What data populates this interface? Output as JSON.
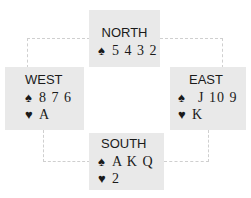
{
  "hands": {
    "north": {
      "label": "NORTH",
      "spades_symbol": "♠",
      "spades": "5 4 3 2"
    },
    "west": {
      "label": "WEST",
      "spades_symbol": "♠",
      "spades": "8 7 6",
      "hearts_symbol": "♥",
      "hearts": "A"
    },
    "east": {
      "label": "EAST",
      "spades_symbol": "♠",
      "spades": "J 10 9",
      "hearts_symbol": "♥",
      "hearts": "K"
    },
    "south": {
      "label": "SOUTH",
      "spades_symbol": "♠",
      "spades": "A K Q",
      "hearts_symbol": "♥",
      "hearts": "2"
    }
  },
  "colors": {
    "box_bg": "#e9e9e9",
    "connector": "#cfcfcf",
    "text": "#1a1a1a"
  }
}
